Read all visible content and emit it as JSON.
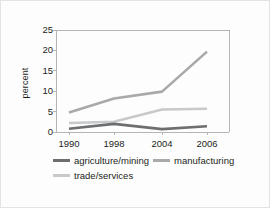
{
  "chart_data": {
    "type": "line",
    "title": "",
    "xlabel": "",
    "ylabel": "percent",
    "categories": [
      "1990",
      "1998",
      "2004",
      "2006"
    ],
    "x": [
      1990,
      1998,
      2004,
      2006
    ],
    "ylim": [
      0,
      25
    ],
    "yticks": [
      0,
      5,
      10,
      15,
      20,
      25
    ],
    "ytick_labels": [
      "0",
      "5",
      "10",
      "15",
      "20",
      "25"
    ],
    "grid": false,
    "legend_position": "bottom",
    "series": [
      {
        "name": "agriculture/mining",
        "color": "#6d6e70",
        "values": [
          0.8,
          2.0,
          0.7,
          1.4
        ]
      },
      {
        "name": "manufacturing",
        "color": "#a7a9ab",
        "values": [
          4.8,
          8.2,
          9.9,
          19.7
        ]
      },
      {
        "name": "trade/services",
        "color": "#c8c9ca",
        "values": [
          2.2,
          2.5,
          5.5,
          5.7
        ]
      }
    ]
  },
  "legend": {
    "rows": [
      [
        {
          "label": "agriculture/mining",
          "color": "#6d6e70"
        },
        {
          "label": "manufacturing",
          "color": "#a7a9ab"
        }
      ],
      [
        {
          "label": "trade/services",
          "color": "#c8c9ca"
        }
      ]
    ]
  },
  "axis": {
    "frame_color": "#b5b5b5",
    "text_color": "#231f20"
  }
}
